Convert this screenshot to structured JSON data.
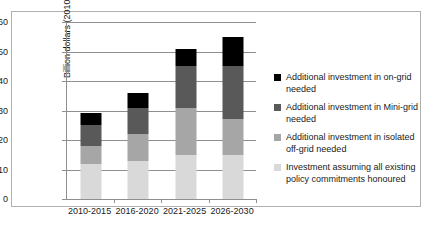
{
  "chart_data": {
    "type": "bar",
    "title": "",
    "subtitle": "",
    "xlabel": "",
    "ylabel": "Billion dollars (2010)",
    "categories": [
      "2010-2015",
      "2016-2020",
      "2021-2025",
      "2026-2030"
    ],
    "ylim": [
      0,
      60
    ],
    "yticks": [
      0,
      10,
      20,
      30,
      40,
      50,
      60
    ],
    "ytick_labels": [
      "0",
      "10",
      "20",
      "30",
      "40",
      "50",
      "60"
    ],
    "grid": true,
    "stacked": true,
    "legend_position": "right",
    "series": [
      {
        "name": "Investment assuming all existing policy commitments honoured",
        "color": "#d9d9d9",
        "values": [
          12,
          13,
          15,
          15
        ]
      },
      {
        "name": "Additional investment in isolated off-grid needed",
        "color": "#a6a6a6",
        "values": [
          6,
          9,
          16,
          12
        ]
      },
      {
        "name": "Additional investment in Mini-grid needed",
        "color": "#595959",
        "values": [
          7,
          9,
          14,
          18
        ]
      },
      {
        "name": "Additional investment in on-grid needed",
        "color": "#000000",
        "values": [
          4,
          5,
          6,
          10
        ]
      }
    ],
    "totals": [
      29,
      36,
      51,
      55
    ]
  },
  "legend": {
    "entries": [
      {
        "label": "Additional investment in on-grid needed",
        "color": "#000000"
      },
      {
        "label": "Additional investment in Mini-grid needed",
        "color": "#595959"
      },
      {
        "label": "Additional investment in isolated off-grid needed",
        "color": "#a6a6a6"
      },
      {
        "label": "Investment assuming all existing policy commitments honoured",
        "color": "#d9d9d9"
      }
    ]
  },
  "colors": {
    "axis": "#8f8f8f",
    "grid": "#8f8f8f",
    "frame": "#b0b0b0",
    "background": "#ffffff",
    "text": "#1a1a1a"
  }
}
